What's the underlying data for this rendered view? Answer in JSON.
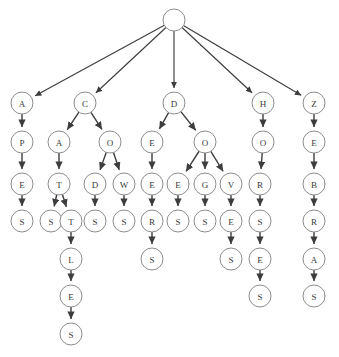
{
  "diagram": {
    "type": "tree",
    "title": "",
    "node_radius": 11,
    "colors": {
      "node_fill": "#ffffff",
      "node_stroke": "#8d8d8d",
      "edge": "#3d3d3d",
      "label": "#3a3a3a",
      "background": "#ffffff"
    },
    "nodes": [
      {
        "id": "n0",
        "label": "",
        "x": 174,
        "y": 20
      },
      {
        "id": "n1",
        "label": "A",
        "x": 22,
        "y": 103
      },
      {
        "id": "n2",
        "label": "C",
        "x": 85,
        "y": 103
      },
      {
        "id": "n3",
        "label": "D",
        "x": 174,
        "y": 103
      },
      {
        "id": "n4",
        "label": "H",
        "x": 263,
        "y": 103
      },
      {
        "id": "n5",
        "label": "Z",
        "x": 314,
        "y": 103
      },
      {
        "id": "n6",
        "label": "P",
        "x": 22,
        "y": 142
      },
      {
        "id": "n7",
        "label": "A",
        "x": 59,
        "y": 142
      },
      {
        "id": "n8",
        "label": "O",
        "x": 110,
        "y": 142
      },
      {
        "id": "n9",
        "label": "E",
        "x": 152,
        "y": 142
      },
      {
        "id": "n10",
        "label": "O",
        "x": 205,
        "y": 142
      },
      {
        "id": "n11",
        "label": "O",
        "x": 263,
        "y": 142
      },
      {
        "id": "n12",
        "label": "E",
        "x": 314,
        "y": 142
      },
      {
        "id": "n13",
        "label": "E",
        "x": 22,
        "y": 184
      },
      {
        "id": "n14",
        "label": "T",
        "x": 59,
        "y": 184
      },
      {
        "id": "n15",
        "label": "D",
        "x": 95,
        "y": 184
      },
      {
        "id": "n16",
        "label": "W",
        "x": 124,
        "y": 184
      },
      {
        "id": "n17",
        "label": "E",
        "x": 152,
        "y": 184
      },
      {
        "id": "n18",
        "label": "E",
        "x": 178,
        "y": 184
      },
      {
        "id": "n19",
        "label": "G",
        "x": 205,
        "y": 184
      },
      {
        "id": "n20",
        "label": "V",
        "x": 231,
        "y": 184
      },
      {
        "id": "n21",
        "label": "R",
        "x": 260,
        "y": 184
      },
      {
        "id": "n22",
        "label": "B",
        "x": 314,
        "y": 184
      },
      {
        "id": "n23",
        "label": "S",
        "x": 22,
        "y": 221
      },
      {
        "id": "n24",
        "label": "S",
        "x": 51,
        "y": 221
      },
      {
        "id": "n25",
        "label": "T",
        "x": 71,
        "y": 221
      },
      {
        "id": "n26",
        "label": "S",
        "x": 95,
        "y": 221
      },
      {
        "id": "n27",
        "label": "S",
        "x": 124,
        "y": 221
      },
      {
        "id": "n28",
        "label": "R",
        "x": 152,
        "y": 221
      },
      {
        "id": "n29",
        "label": "S",
        "x": 178,
        "y": 221
      },
      {
        "id": "n30",
        "label": "S",
        "x": 205,
        "y": 221
      },
      {
        "id": "n31",
        "label": "E",
        "x": 231,
        "y": 221
      },
      {
        "id": "n32",
        "label": "S",
        "x": 260,
        "y": 221
      },
      {
        "id": "n33",
        "label": "R",
        "x": 314,
        "y": 221
      },
      {
        "id": "n34",
        "label": "L",
        "x": 71,
        "y": 259
      },
      {
        "id": "n35",
        "label": "S",
        "x": 152,
        "y": 259
      },
      {
        "id": "n36",
        "label": "S",
        "x": 231,
        "y": 259
      },
      {
        "id": "n37",
        "label": "E",
        "x": 260,
        "y": 259
      },
      {
        "id": "n38",
        "label": "A",
        "x": 314,
        "y": 259
      },
      {
        "id": "n39",
        "label": "E",
        "x": 71,
        "y": 296
      },
      {
        "id": "n40",
        "label": "S",
        "x": 260,
        "y": 296
      },
      {
        "id": "n41",
        "label": "S",
        "x": 314,
        "y": 296
      },
      {
        "id": "n42",
        "label": "S",
        "x": 71,
        "y": 334
      }
    ],
    "edges": [
      {
        "from": "n0",
        "to": "n1"
      },
      {
        "from": "n0",
        "to": "n2"
      },
      {
        "from": "n0",
        "to": "n3"
      },
      {
        "from": "n0",
        "to": "n4"
      },
      {
        "from": "n0",
        "to": "n5"
      },
      {
        "from": "n1",
        "to": "n6"
      },
      {
        "from": "n2",
        "to": "n7"
      },
      {
        "from": "n2",
        "to": "n8"
      },
      {
        "from": "n3",
        "to": "n9"
      },
      {
        "from": "n3",
        "to": "n10"
      },
      {
        "from": "n4",
        "to": "n11"
      },
      {
        "from": "n5",
        "to": "n12"
      },
      {
        "from": "n6",
        "to": "n13"
      },
      {
        "from": "n7",
        "to": "n14"
      },
      {
        "from": "n8",
        "to": "n15"
      },
      {
        "from": "n8",
        "to": "n16"
      },
      {
        "from": "n9",
        "to": "n17"
      },
      {
        "from": "n10",
        "to": "n18"
      },
      {
        "from": "n10",
        "to": "n19"
      },
      {
        "from": "n10",
        "to": "n20"
      },
      {
        "from": "n11",
        "to": "n21"
      },
      {
        "from": "n12",
        "to": "n22"
      },
      {
        "from": "n13",
        "to": "n23"
      },
      {
        "from": "n14",
        "to": "n24"
      },
      {
        "from": "n14",
        "to": "n25"
      },
      {
        "from": "n15",
        "to": "n26"
      },
      {
        "from": "n16",
        "to": "n27"
      },
      {
        "from": "n17",
        "to": "n28"
      },
      {
        "from": "n18",
        "to": "n29"
      },
      {
        "from": "n19",
        "to": "n30"
      },
      {
        "from": "n20",
        "to": "n31"
      },
      {
        "from": "n21",
        "to": "n32"
      },
      {
        "from": "n22",
        "to": "n33"
      },
      {
        "from": "n25",
        "to": "n34"
      },
      {
        "from": "n28",
        "to": "n35"
      },
      {
        "from": "n31",
        "to": "n36"
      },
      {
        "from": "n32",
        "to": "n37"
      },
      {
        "from": "n33",
        "to": "n38"
      },
      {
        "from": "n34",
        "to": "n39"
      },
      {
        "from": "n37",
        "to": "n40"
      },
      {
        "from": "n38",
        "to": "n41"
      },
      {
        "from": "n39",
        "to": "n42"
      }
    ]
  }
}
